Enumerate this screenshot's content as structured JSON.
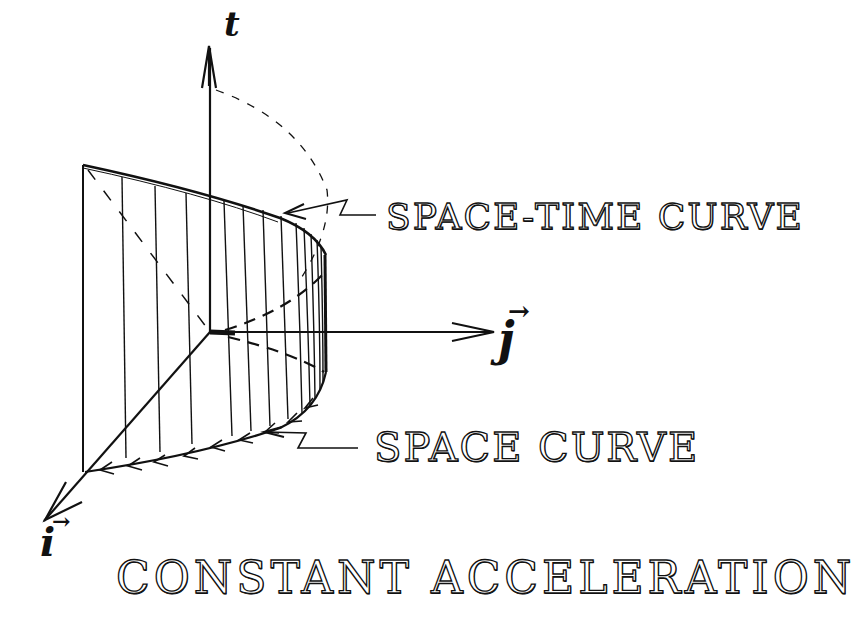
{
  "diagram": {
    "title": "CONSTANT ACCELERATION",
    "labels": {
      "space_time_curve": "SPACE-TIME CURVE",
      "space_curve": "SPACE CURVE"
    },
    "axes": {
      "t": {
        "label": "t",
        "direction": "up"
      },
      "j": {
        "label": "j",
        "vector_arrow": "→",
        "direction": "right"
      },
      "i": {
        "label": "i",
        "vector_arrow": "→",
        "direction": "down-left"
      }
    },
    "colors": {
      "ink": "#111111",
      "background": "#ffffff"
    }
  }
}
